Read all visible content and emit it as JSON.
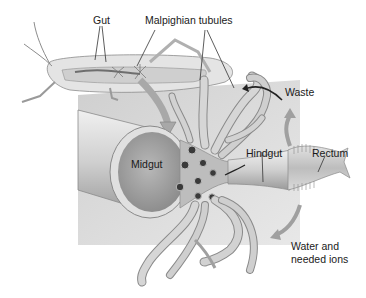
{
  "diagram": {
    "labels": {
      "gut": "Gut",
      "malpighian_tubules": "Malpighian tubules",
      "waste": "Waste",
      "midgut": "Midgut",
      "hindgut": "Hindgut",
      "rectum": "Rectum",
      "water_line1": "Water and",
      "water_line2": "needed ions"
    },
    "colors": {
      "background": "#ffffff",
      "panel": "#d9d9d9",
      "tissue_light": "#e6e6e6",
      "tissue_mid": "#c4c4c4",
      "tissue_dark": "#7a7a7a",
      "lumen": "#a8a8a8",
      "pore": "#3a3a3a",
      "leader_line": "#333333"
    }
  }
}
